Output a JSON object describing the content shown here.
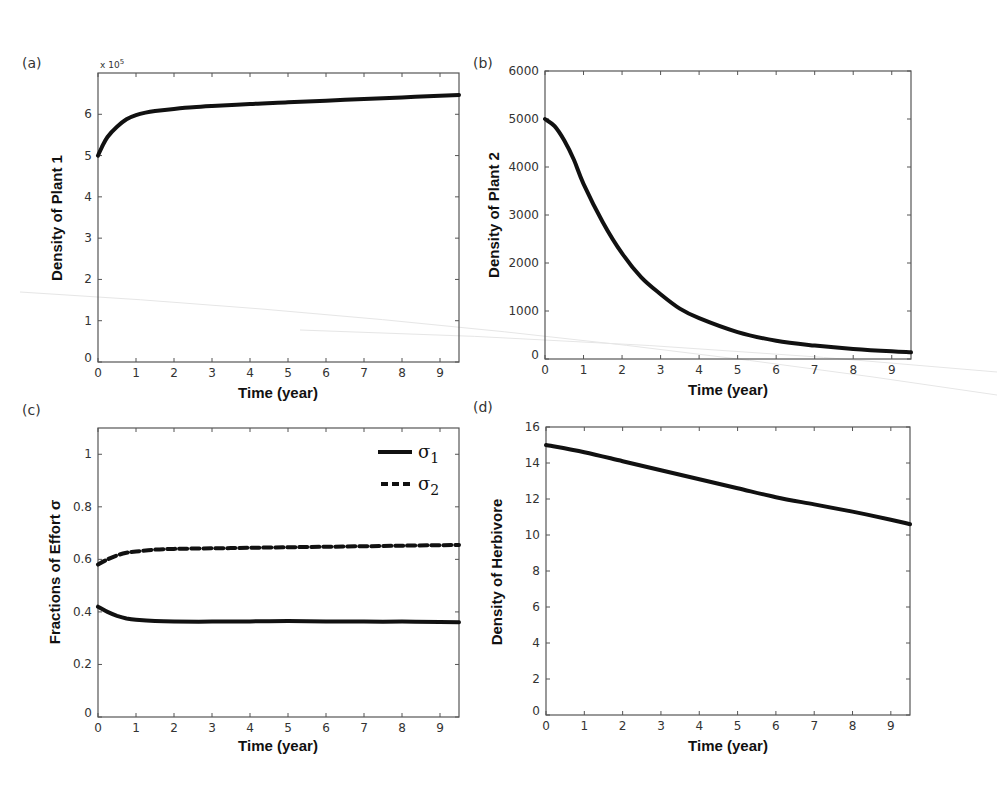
{
  "figure": {
    "panels": [
      {
        "id": "a",
        "label": "(a)"
      },
      {
        "id": "b",
        "label": "(b)"
      },
      {
        "id": "c",
        "label": "(c)"
      },
      {
        "id": "d",
        "label": "(d)"
      }
    ]
  },
  "chart_data": [
    {
      "type": "line",
      "panel": "(a)",
      "title": "",
      "xlabel": "Time (year)",
      "ylabel": "Density of Plant 1",
      "y_multiplier_label": "x 10^5",
      "xlim": [
        0,
        9.5
      ],
      "ylim": [
        0,
        7
      ],
      "xticks": [
        0,
        1,
        2,
        3,
        4,
        5,
        6,
        7,
        8,
        9
      ],
      "yticks": [
        0,
        1,
        2,
        3,
        4,
        5,
        6
      ],
      "grid": false,
      "series": [
        {
          "name": "Plant 1",
          "style": "solid",
          "x": [
            0,
            0.1,
            0.25,
            0.5,
            0.75,
            1,
            1.25,
            1.5,
            2,
            2.5,
            3,
            4,
            5,
            6,
            7,
            8,
            9,
            9.5
          ],
          "y": [
            5.0,
            5.2,
            5.45,
            5.7,
            5.88,
            5.98,
            6.04,
            6.08,
            6.13,
            6.17,
            6.2,
            6.25,
            6.29,
            6.33,
            6.37,
            6.41,
            6.45,
            6.47
          ]
        }
      ]
    },
    {
      "type": "line",
      "panel": "(b)",
      "title": "",
      "xlabel": "Time (year)",
      "ylabel": "Density of Plant 2",
      "xlim": [
        0,
        9.5
      ],
      "ylim": [
        0,
        6000
      ],
      "xticks": [
        0,
        1,
        2,
        3,
        4,
        5,
        6,
        7,
        8,
        9
      ],
      "yticks": [
        0,
        1000,
        2000,
        3000,
        4000,
        5000,
        6000
      ],
      "grid": false,
      "series": [
        {
          "name": "Plant 2",
          "style": "solid",
          "x": [
            0,
            0.25,
            0.5,
            0.75,
            1,
            1.5,
            2,
            2.5,
            3,
            3.5,
            4,
            5,
            6,
            7,
            8,
            9,
            9.5
          ],
          "y": [
            5000,
            4850,
            4550,
            4150,
            3650,
            2850,
            2200,
            1700,
            1350,
            1050,
            850,
            560,
            380,
            280,
            210,
            160,
            140
          ]
        }
      ]
    },
    {
      "type": "line",
      "panel": "(c)",
      "title": "",
      "xlabel": "Time (year)",
      "ylabel": "Fractions of Effort σ",
      "xlim": [
        0,
        9.5
      ],
      "ylim": [
        0,
        1.1
      ],
      "xticks": [
        0,
        1,
        2,
        3,
        4,
        5,
        6,
        7,
        8,
        9
      ],
      "yticks": [
        0,
        0.2,
        0.4,
        0.6,
        0.8,
        1
      ],
      "ytick_labels": [
        "0",
        "0.2",
        "0.4",
        "0.6",
        "0.8",
        "1"
      ],
      "grid": false,
      "legend": {
        "position": "upper right",
        "entries": [
          "σ1",
          "σ2"
        ]
      },
      "series": [
        {
          "name": "σ1",
          "style": "solid",
          "x": [
            0,
            0.25,
            0.5,
            0.75,
            1,
            1.5,
            2,
            3,
            4,
            5,
            6,
            7,
            8,
            9,
            9.5
          ],
          "y": [
            0.42,
            0.4,
            0.385,
            0.375,
            0.37,
            0.365,
            0.363,
            0.363,
            0.364,
            0.365,
            0.364,
            0.363,
            0.363,
            0.362,
            0.361
          ]
        },
        {
          "name": "σ2",
          "style": "dashed",
          "x": [
            0,
            0.25,
            0.5,
            0.75,
            1,
            1.5,
            2,
            3,
            4,
            5,
            6,
            7,
            8,
            9,
            9.5
          ],
          "y": [
            0.58,
            0.6,
            0.615,
            0.625,
            0.63,
            0.637,
            0.64,
            0.642,
            0.644,
            0.646,
            0.648,
            0.65,
            0.652,
            0.654,
            0.655
          ]
        }
      ]
    },
    {
      "type": "line",
      "panel": "(d)",
      "title": "",
      "xlabel": "Time (year)",
      "ylabel": "Density of Herbivore",
      "xlim": [
        0,
        9.5
      ],
      "ylim": [
        0,
        16
      ],
      "xticks": [
        0,
        1,
        2,
        3,
        4,
        5,
        6,
        7,
        8,
        9
      ],
      "yticks": [
        0,
        2,
        4,
        6,
        8,
        10,
        12,
        14,
        16
      ],
      "grid": false,
      "series": [
        {
          "name": "Herbivore",
          "style": "solid",
          "x": [
            0,
            1,
            2,
            3,
            4,
            5,
            6,
            7,
            8,
            9,
            9.5
          ],
          "y": [
            15.0,
            14.6,
            14.1,
            13.6,
            13.1,
            12.6,
            12.1,
            11.7,
            11.3,
            10.85,
            10.6
          ]
        }
      ]
    }
  ]
}
